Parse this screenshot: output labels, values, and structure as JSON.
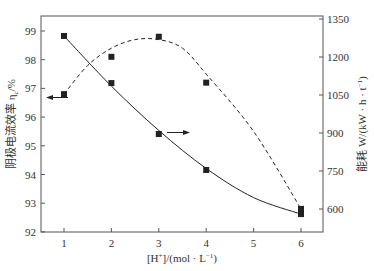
{
  "chart_data": {
    "type": "line",
    "title": "",
    "xlabel": "[H⁺]/(mol·L⁻¹)",
    "ylabel_left": "阴极电流效率 ηc /%",
    "ylabel_right": "能耗 W/(kW·h·t⁻¹)",
    "x": [
      1,
      2,
      3,
      4,
      6
    ],
    "x_ticks": [
      "1",
      "2",
      "3",
      "4",
      "5",
      "6"
    ],
    "y_left_ticks": [
      "92",
      "93",
      "94",
      "95",
      "96",
      "97",
      "98",
      "99"
    ],
    "y_right_ticks": [
      "600",
      "750",
      "900",
      "1050",
      "1200",
      "1350"
    ],
    "ylim_left": [
      92,
      99.5
    ],
    "ylim_right": [
      450,
      1350
    ],
    "xlim": [
      0.5,
      7
    ],
    "grid": false,
    "legend": "arrows indicate axis: dashed curve → left axis, solid curve → right axis",
    "series": [
      {
        "name": "阴极电流效率 ηc/%",
        "axis": "left",
        "style": "dashed",
        "marker": "square",
        "values": [
          96.8,
          98.1,
          98.8,
          97.2,
          92.8
        ]
      },
      {
        "name": "能耗 W/(kW·h·t⁻¹)",
        "axis": "right",
        "style": "solid",
        "marker": "square",
        "values": [
          1283,
          1097,
          896,
          754,
          580
        ]
      }
    ]
  },
  "labels": {
    "xlabel_main": "[H",
    "xlabel_sup": "+",
    "xlabel_rest": "]/(mol · L",
    "xlabel_sup2": "−1",
    "xlabel_end": ")",
    "ylabel_left_main": "阴极电流效率 η",
    "ylabel_left_sub": "c",
    "ylabel_left_end": "/%",
    "ylabel_right_main": "能耗 W/(kW · h · t",
    "ylabel_right_sup": "−1",
    "ylabel_right_end": ")"
  },
  "colors": {
    "axis": "#555555",
    "series": "#222222"
  }
}
